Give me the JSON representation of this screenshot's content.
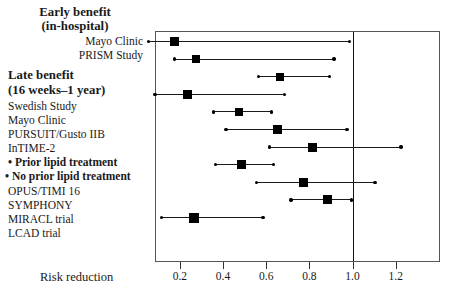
{
  "figure": {
    "x_axis_label": "Risk reduction",
    "reference_value": 1.0,
    "axis_min": 0.085,
    "axis_max": 1.405
  },
  "labels": {
    "heading_early_1": "Early benefit",
    "heading_early_2": "(in-hospital)",
    "heading_late_1": "Late benefit",
    "heading_late_2": "(16 weeks–1 year)",
    "mayo_early": "Mayo Clinic",
    "prism": "PRISM Study",
    "swedish": "Swedish Study",
    "mayo_late": "Mayo Clinic",
    "pursuit": "PURSUIT/Gusto IIB",
    "intime2": "InTIME-2",
    "prior_lipid": "• Prior lipid treatment",
    "no_prior_lipid": "• No prior lipid treatment",
    "opus": "OPUS/TIMI 16",
    "symphony": "SYMPHONY",
    "miracl": "MIRACL trial",
    "lcad": "LCAD trial"
  },
  "axis_ticks": [
    {
      "label": "0.2",
      "value": 0.2
    },
    {
      "label": "0.4",
      "value": 0.4
    },
    {
      "label": "0.6",
      "value": 0.6
    },
    {
      "label": "0.8",
      "value": 0.8
    },
    {
      "label": "1.0",
      "value": 1.0
    },
    {
      "label": "1.2",
      "value": 1.2
    }
  ],
  "chart_data": {
    "type": "scatter",
    "subtype": "forest-plot",
    "title": "",
    "xlabel": "Risk reduction",
    "ylabel": "",
    "xlim": [
      0.085,
      1.405
    ],
    "grid": false,
    "legend": "none",
    "reference_line": 1.0,
    "marker_shape": "square",
    "categories": [
      "Mayo Clinic",
      "PRISM Study",
      "Swedish Study",
      "Mayo Clinic",
      "PURSUIT/Gusto IIB",
      "InTIME-2",
      "• Prior lipid treatment",
      "• No prior lipid treatment",
      "OPUS/TIMI 16",
      "SYMPHONY",
      "MIRACL trial",
      "LCAD trial"
    ],
    "groups": [
      {
        "name": "Early benefit (in-hospital)",
        "categories": [
          "Mayo Clinic",
          "PRISM Study"
        ]
      },
      {
        "name": "Late benefit (16 weeks–1 year)",
        "categories": [
          "Swedish Study",
          "Mayo Clinic",
          "PURSUIT/Gusto IIB",
          "InTIME-2",
          "• Prior lipid treatment",
          "• No prior lipid treatment",
          "OPUS/TIMI 16",
          "SYMPHONY",
          "MIRACL trial",
          "LCAD trial"
        ]
      }
    ],
    "points": [
      {
        "label": "Mayo Clinic",
        "group": "early",
        "estimate": 0.17,
        "ci_low": 0.05,
        "ci_high": 0.98,
        "marker_size": 9,
        "row": 0,
        "emphasis": false
      },
      {
        "label": "PRISM Study",
        "group": "early",
        "estimate": 0.27,
        "ci_low": 0.17,
        "ci_high": 0.91,
        "marker_size": 8,
        "row": 1,
        "emphasis": false
      },
      {
        "label": "Swedish Study",
        "group": "late",
        "estimate": 0.66,
        "ci_low": 0.56,
        "ci_high": 0.89,
        "marker_size": 8,
        "row": 2,
        "emphasis": false
      },
      {
        "label": "Mayo Clinic",
        "group": "late",
        "estimate": 0.23,
        "ci_low": 0.08,
        "ci_high": 0.68,
        "marker_size": 9,
        "row": 3,
        "emphasis": false
      },
      {
        "label": "PURSUIT/Gusto IIB",
        "group": "late",
        "estimate": 0.47,
        "ci_low": 0.35,
        "ci_high": 0.62,
        "marker_size": 8,
        "row": 4,
        "emphasis": false
      },
      {
        "label": "• Prior lipid treatment",
        "group": "late",
        "estimate": 0.65,
        "ci_low": 0.41,
        "ci_high": 0.97,
        "marker_size": 9,
        "row": 5,
        "emphasis": true
      },
      {
        "label": "• No prior lipid treatment",
        "group": "late",
        "estimate": 0.81,
        "ci_low": 0.61,
        "ci_high": 1.22,
        "marker_size": 9,
        "row": 6,
        "emphasis": true
      },
      {
        "label": "OPUS/TIMI 16",
        "group": "late",
        "estimate": 0.48,
        "ci_low": 0.36,
        "ci_high": 0.63,
        "marker_size": 9,
        "row": 7,
        "emphasis": false
      },
      {
        "label": "SYMPHONY",
        "group": "late",
        "estimate": 0.77,
        "ci_low": 0.55,
        "ci_high": 1.1,
        "marker_size": 9,
        "row": 8,
        "emphasis": false
      },
      {
        "label": "MIRACL trial",
        "group": "late",
        "estimate": 0.88,
        "ci_low": 0.71,
        "ci_high": 0.99,
        "marker_size": 9,
        "row": 9,
        "emphasis": false
      },
      {
        "label": "LCAD trial",
        "group": "late",
        "estimate": 0.26,
        "ci_low": 0.11,
        "ci_high": 0.58,
        "marker_size": 10,
        "row": 10,
        "emphasis": false
      }
    ]
  },
  "colors": {
    "marker": "#000000",
    "ci_line": "#1a1a1a",
    "reference_line": "#111111",
    "frame": "#555555",
    "text": "#1a1a1a",
    "background": "#ffffff"
  }
}
